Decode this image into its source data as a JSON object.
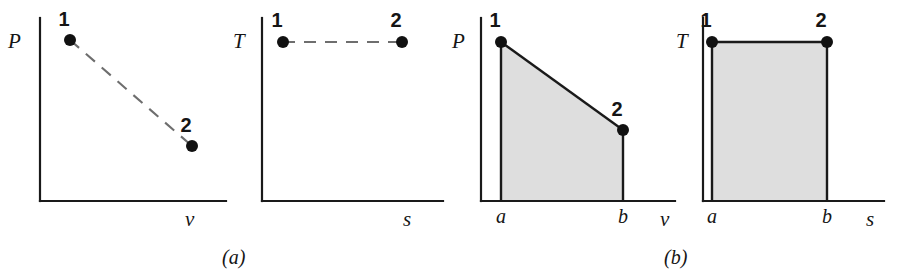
{
  "figure": {
    "background_color": "#ffffff",
    "line_color": "#1a1a1a",
    "dashed_color": "#6e6e6e",
    "shade_color": "#dedede",
    "dot_color": "#111111"
  },
  "captions": [
    {
      "id": "caption-a",
      "text": "(a)",
      "x": 222,
      "y": 246
    },
    {
      "id": "caption-b",
      "text": "(b)",
      "x": 664,
      "y": 246
    }
  ],
  "chart_data": [
    {
      "id": "panel-1",
      "type": "line",
      "title": "",
      "process_style": "dashed",
      "shaded": false,
      "ylabel": "P",
      "xlabel": "v",
      "ylabel_pos": {
        "x": 8,
        "y": 48
      },
      "xlabel_pos": {
        "x": 185,
        "y": 226
      },
      "axes": {
        "x0": 40,
        "y0": 201,
        "x1": 226,
        "ytop": 18
      },
      "points": [
        {
          "label": "1",
          "x": 70,
          "y": 40,
          "label_x": 64,
          "label_y": 26
        },
        {
          "label": "2",
          "x": 192,
          "y": 146,
          "label_x": 186,
          "label_y": 132
        }
      ],
      "dot_radius": 6
    },
    {
      "id": "panel-2",
      "type": "line",
      "title": "",
      "process_style": "dashed",
      "shaded": false,
      "ylabel": "T",
      "xlabel": "s",
      "ylabel_pos": {
        "x": 233,
        "y": 48
      },
      "xlabel_pos": {
        "x": 403,
        "y": 226
      },
      "axes": {
        "x0": 262,
        "y0": 201,
        "x1": 443,
        "ytop": 18
      },
      "points": [
        {
          "label": "1",
          "x": 283,
          "y": 42,
          "label_x": 277,
          "label_y": 27
        },
        {
          "label": "2",
          "x": 402,
          "y": 42,
          "label_x": 396,
          "label_y": 27
        }
      ],
      "dot_radius": 6
    },
    {
      "id": "panel-3",
      "type": "area",
      "title": "",
      "process_style": "solid",
      "shaded": true,
      "ylabel": "P",
      "xlabel": "v",
      "ylabel_pos": {
        "x": 452,
        "y": 48
      },
      "xlabel_pos": {
        "x": 660,
        "y": 226
      },
      "axes": {
        "x0": 481,
        "y0": 201,
        "x1": 675,
        "ytop": 18
      },
      "points": [
        {
          "label": "1",
          "x": 501,
          "y": 42,
          "label_x": 495,
          "label_y": 27
        },
        {
          "label": "2",
          "x": 623,
          "y": 130,
          "label_x": 617,
          "label_y": 116
        }
      ],
      "ticks": [
        {
          "label": "a",
          "x": 501,
          "y": 223
        },
        {
          "label": "b",
          "x": 623,
          "y": 223
        }
      ],
      "area_polygon": "501,42 623,130 623,201 501,201",
      "dot_radius": 6
    },
    {
      "id": "panel-4",
      "type": "area",
      "title": "",
      "process_style": "solid",
      "shaded": true,
      "ylabel": "T",
      "xlabel": "s",
      "ylabel_pos": {
        "x": 676,
        "y": 48
      },
      "xlabel_pos": {
        "x": 866,
        "y": 226
      },
      "axes": {
        "x0": 703,
        "y0": 201,
        "x1": 884,
        "ytop": 18
      },
      "points": [
        {
          "label": "1",
          "x": 712,
          "y": 42,
          "label_x": 706,
          "label_y": 27
        },
        {
          "label": "2",
          "x": 827,
          "y": 42,
          "label_x": 821,
          "label_y": 27
        }
      ],
      "ticks": [
        {
          "label": "a",
          "x": 712,
          "y": 223
        },
        {
          "label": "b",
          "x": 827,
          "y": 223
        }
      ],
      "area_polygon": "712,42 827,42 827,201 712,201",
      "dot_radius": 6
    }
  ]
}
